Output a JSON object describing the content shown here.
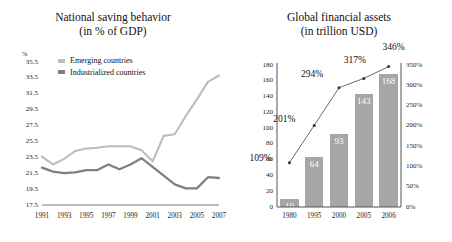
{
  "left": {
    "title_line1": "National saving behavior",
    "title_line2": "(in % of GDP)",
    "unit_label": "%",
    "legend": [
      {
        "label": "Emerging countries",
        "color": "#bdbdbd"
      },
      {
        "label": "Industrialized countries",
        "color": "#808080"
      }
    ]
  },
  "right": {
    "title_line1": "Global financial assets",
    "title_line2": "(in trillion USD)"
  },
  "chart_data": [
    {
      "type": "line",
      "title": "National saving behavior (in % of GDP)",
      "xlabel": "",
      "ylabel": "%",
      "ylim": [
        17.5,
        35.5
      ],
      "yticks": [
        17.5,
        19.5,
        21.5,
        23.5,
        25.5,
        27.5,
        29.5,
        31.5,
        33.5,
        35.5
      ],
      "xticks": [
        1991,
        1993,
        1995,
        1997,
        1999,
        2001,
        2003,
        2005,
        2007
      ],
      "x": [
        1991,
        1992,
        1993,
        1994,
        1995,
        1996,
        1997,
        1998,
        1999,
        2000,
        2001,
        2002,
        2003,
        2004,
        2005,
        2006,
        2007
      ],
      "grid": false,
      "legend_position": "top-left",
      "series": [
        {
          "name": "Emerging countries",
          "color": "#bdbdbd",
          "values": [
            23.6,
            22.6,
            23.3,
            24.3,
            24.6,
            24.7,
            24.9,
            24.9,
            24.9,
            24.4,
            23.0,
            26.2,
            26.4,
            28.7,
            30.8,
            33.0,
            33.8
          ]
        },
        {
          "name": "Industrialized countries",
          "color": "#808080",
          "values": [
            22.2,
            21.7,
            21.5,
            21.6,
            21.9,
            21.9,
            22.6,
            22.0,
            22.6,
            23.4,
            22.3,
            21.2,
            20.1,
            19.6,
            19.6,
            21.0,
            20.9
          ]
        }
      ]
    },
    {
      "type": "bar",
      "title": "Global financial assets (in trillion USD)",
      "xlabel": "",
      "ylabel": "",
      "categories": [
        "1980",
        "1995",
        "2000",
        "2005",
        "2006"
      ],
      "values": [
        10,
        64,
        93,
        143,
        168
      ],
      "ylim": [
        0,
        180
      ],
      "yticks": [
        0,
        20,
        40,
        60,
        80,
        100,
        120,
        140,
        160,
        180
      ],
      "bar_color": "#a6a6a6",
      "grid": false,
      "secondary_axis": {
        "name": "percent-of-gdp",
        "ylim": [
          0,
          350
        ],
        "yticks": [
          "0%",
          "50%",
          "100%",
          "150%",
          "200%",
          "250%",
          "300%",
          "350%"
        ],
        "values": [
          109,
          201,
          294,
          317,
          346
        ],
        "labels": [
          "109%",
          "201%",
          "294%",
          "317%",
          "346%"
        ],
        "type": "line",
        "color": "#5a5a5a"
      }
    }
  ]
}
